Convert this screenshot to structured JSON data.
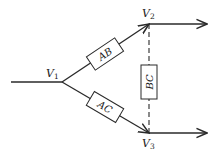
{
  "diagram": {
    "type": "network-flow",
    "nodes": [
      {
        "id": "V1",
        "letter": "V",
        "subscript": "1"
      },
      {
        "id": "V2",
        "letter": "V",
        "subscript": "2"
      },
      {
        "id": "V3",
        "letter": "V",
        "subscript": "3"
      }
    ],
    "branches": [
      {
        "id": "AB",
        "label": "AB",
        "from": "V1",
        "to": "V2",
        "style": "solid-arrow"
      },
      {
        "id": "AC",
        "label": "AC",
        "from": "V1",
        "to": "V3",
        "style": "solid-arrow"
      },
      {
        "id": "BC",
        "label": "BC",
        "from": "V2",
        "to": "V3",
        "style": "dashed",
        "orientation": "vertical"
      }
    ],
    "input": {
      "to": "V1"
    },
    "outputs": [
      {
        "from": "V2"
      },
      {
        "from": "V3"
      }
    ],
    "colors": {
      "stroke": "#2a2a2a",
      "background": "#ffffff"
    }
  }
}
